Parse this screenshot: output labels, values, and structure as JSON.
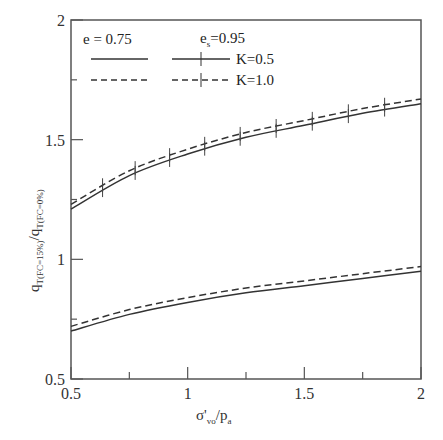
{
  "chart_data": {
    "type": "line",
    "title": "",
    "xlabel": "σ'vo/pa",
    "ylabel": "qT(FC=15%)/qT(FC=0%)",
    "xlim": [
      0.5,
      2
    ],
    "ylim": [
      0.5,
      2
    ],
    "x_ticks": [
      "0.5",
      "1",
      "1.5",
      "2"
    ],
    "y_ticks": [
      "0.5",
      "1",
      "1.5",
      "2"
    ],
    "x_minor_ticks": [
      0.75,
      1.25,
      1.75
    ],
    "y_minor_ticks": [
      0.75,
      1.25,
      1.75
    ],
    "grid": false,
    "legend": {
      "position": "upper-left",
      "groups": [
        {
          "label": "e = 0.75",
          "entries": [
            {
              "style": "solid"
            },
            {
              "style": "dashed"
            }
          ]
        },
        {
          "label": "es=0.95",
          "entries": [
            {
              "style": "solid-plus",
              "label": "K=0.5"
            },
            {
              "style": "dashed-plus",
              "label": "K=1.0"
            }
          ]
        }
      ]
    },
    "x": [
      0.5,
      0.75,
      1.0,
      1.25,
      1.5,
      1.75,
      2.0
    ],
    "series": [
      {
        "name": "es=0.95, K=0.5",
        "style": "solid",
        "marker": "plus",
        "values": [
          1.21,
          1.35,
          1.44,
          1.51,
          1.56,
          1.61,
          1.65
        ]
      },
      {
        "name": "es=0.95, K=1.0",
        "style": "dashed",
        "marker": "plus",
        "values": [
          1.23,
          1.37,
          1.46,
          1.53,
          1.58,
          1.63,
          1.67
        ]
      },
      {
        "name": "e=0.75, K=0.5",
        "style": "solid",
        "marker": "none",
        "values": [
          0.7,
          0.77,
          0.82,
          0.86,
          0.89,
          0.92,
          0.95
        ]
      },
      {
        "name": "e=0.75, K=1.0",
        "style": "dashed",
        "marker": "none",
        "values": [
          0.72,
          0.79,
          0.84,
          0.88,
          0.91,
          0.94,
          0.97
        ]
      }
    ]
  },
  "labels": {
    "legend_e": "e = 0.75",
    "legend_es_main": "e",
    "legend_es_sub": "s",
    "legend_es_val": "=0.95",
    "legend_k05": "K=0.5",
    "legend_k10": "K=1.0",
    "xlabel_main": "σ'",
    "xlabel_sub": "vo",
    "xlabel_slash": "/p",
    "xlabel_sub2": "a",
    "ylabel_q1": "q",
    "ylabel_sub1": "T(FC=15%)",
    "ylabel_slash": "/q",
    "ylabel_sub2": "T(FC=0%)"
  }
}
